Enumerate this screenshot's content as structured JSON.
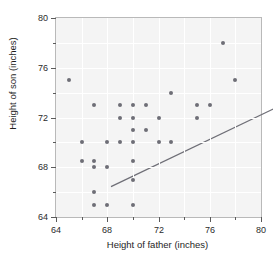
{
  "chart_data": {
    "type": "scatter",
    "title": "",
    "xlabel": "Height of father (inches)",
    "ylabel": "Height of son (inches)",
    "xlim": [
      64,
      80
    ],
    "ylim": [
      64,
      80
    ],
    "x_ticks": [
      64,
      68,
      72,
      76,
      80
    ],
    "y_ticks": [
      64,
      68,
      72,
      76,
      80
    ],
    "x_minor_ticks": [
      66,
      70,
      74,
      78
    ],
    "y_minor_ticks": [
      66,
      70,
      74,
      78
    ],
    "grid": true,
    "legend": "none",
    "marker_color": "#6e6e76",
    "line_color": "#6e6e76",
    "plot_background": "#f4f4f4",
    "points": [
      [
        65,
        75
      ],
      [
        66,
        70
      ],
      [
        66,
        68.5
      ],
      [
        67,
        73
      ],
      [
        67,
        68.5
      ],
      [
        67,
        68
      ],
      [
        67,
        66
      ],
      [
        67,
        65
      ],
      [
        68,
        70
      ],
      [
        68,
        68
      ],
      [
        68,
        65
      ],
      [
        69,
        73
      ],
      [
        69,
        72
      ],
      [
        69,
        70
      ],
      [
        70,
        73
      ],
      [
        70,
        72
      ],
      [
        70,
        71
      ],
      [
        70,
        70
      ],
      [
        70,
        68.5
      ],
      [
        70,
        67
      ],
      [
        70,
        65
      ],
      [
        71,
        73
      ],
      [
        71,
        71
      ],
      [
        72,
        72
      ],
      [
        72,
        70
      ],
      [
        73,
        74
      ],
      [
        73,
        70
      ],
      [
        75,
        73
      ],
      [
        75,
        72
      ],
      [
        76,
        73
      ],
      [
        77,
        78
      ],
      [
        78,
        75
      ]
    ],
    "fit_line": {
      "x_start": 64,
      "y_start": 67.8,
      "x_end": 80,
      "y_end": 75.7
    }
  }
}
